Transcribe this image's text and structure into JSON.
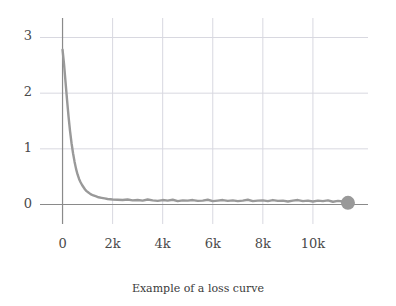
{
  "caption": "Example of a loss curve",
  "colors": {
    "line": "#999999",
    "grid": "#d8d8e0",
    "axis": "#8a8a8a",
    "tick_text": "#4a4a4a",
    "caption_text": "#3a3a3a",
    "background": "#ffffff"
  },
  "chart_data": {
    "type": "line",
    "title": "",
    "subtitle": "",
    "caption": "Example of a loss curve",
    "xlabel": "",
    "ylabel": "",
    "xlim": [
      -900,
      12200
    ],
    "ylim": [
      -0.35,
      3.35
    ],
    "grid": true,
    "legend": false,
    "xticks": [
      0,
      2000,
      4000,
      6000,
      8000,
      10000
    ],
    "xtick_labels": [
      "0",
      "2k",
      "4k",
      "6k",
      "8k",
      "10k"
    ],
    "yticks": [
      0,
      1,
      2,
      3
    ],
    "ytick_labels": [
      "0",
      "1",
      "2",
      "3"
    ],
    "marker_end": {
      "x": 11400,
      "y": 0.03,
      "size": 7
    },
    "series": [
      {
        "name": "loss",
        "x": [
          0,
          60,
          120,
          180,
          240,
          300,
          360,
          420,
          480,
          540,
          600,
          660,
          720,
          780,
          840,
          900,
          960,
          1020,
          1080,
          1140,
          1200,
          1320,
          1440,
          1560,
          1680,
          1800,
          2000,
          2200,
          2400,
          2600,
          2800,
          3000,
          3200,
          3400,
          3600,
          3800,
          4000,
          4200,
          4400,
          4600,
          4800,
          5000,
          5200,
          5400,
          5600,
          5800,
          6000,
          6200,
          6400,
          6600,
          6800,
          7000,
          7200,
          7400,
          7600,
          7800,
          8000,
          8200,
          8400,
          8600,
          8800,
          9000,
          9200,
          9400,
          9600,
          9800,
          10000,
          10200,
          10400,
          10600,
          10800,
          11000,
          11200,
          11400
        ],
        "y": [
          2.78,
          2.52,
          2.2,
          1.88,
          1.58,
          1.32,
          1.1,
          0.92,
          0.77,
          0.64,
          0.54,
          0.46,
          0.4,
          0.35,
          0.31,
          0.27,
          0.24,
          0.22,
          0.2,
          0.18,
          0.17,
          0.15,
          0.13,
          0.12,
          0.11,
          0.1,
          0.09,
          0.085,
          0.08,
          0.09,
          0.075,
          0.08,
          0.07,
          0.09,
          0.075,
          0.065,
          0.08,
          0.07,
          0.085,
          0.06,
          0.075,
          0.07,
          0.08,
          0.065,
          0.07,
          0.085,
          0.06,
          0.07,
          0.08,
          0.065,
          0.075,
          0.06,
          0.07,
          0.085,
          0.06,
          0.07,
          0.075,
          0.06,
          0.08,
          0.065,
          0.07,
          0.055,
          0.07,
          0.08,
          0.06,
          0.07,
          0.055,
          0.07,
          0.06,
          0.075,
          0.05,
          0.065,
          0.055,
          0.03
        ]
      }
    ]
  }
}
